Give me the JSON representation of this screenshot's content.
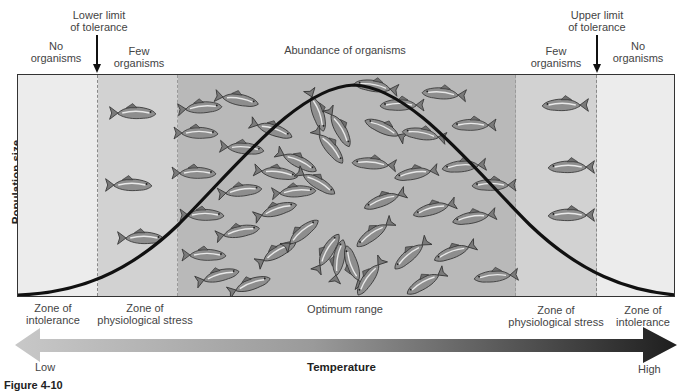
{
  "top_labels": {
    "lower_limit": [
      "Lower limit",
      "of tolerance"
    ],
    "upper_limit": [
      "Upper limit",
      "of tolerance"
    ],
    "left_no": [
      "No",
      "organisms"
    ],
    "left_few": [
      "Few",
      "organisms"
    ],
    "abundance": "Abundance of organisms",
    "right_few": [
      "Few",
      "organisms"
    ],
    "right_no": [
      "No",
      "organisms"
    ]
  },
  "y_axis_label": "Population size",
  "bottom_labels": {
    "left_intolerance": [
      "Zone of",
      "intolerance"
    ],
    "left_stress": [
      "Zone of",
      "physiological stress"
    ],
    "optimum": "Optimum range",
    "right_stress": [
      "Zone of",
      "physiological stress"
    ],
    "right_intolerance": [
      "Zone of",
      "intolerance"
    ]
  },
  "axis": {
    "low": "Low",
    "title": "Temperature",
    "high": "High"
  },
  "caption_fragment": "Figure 4-10",
  "colors": {
    "intolerance_zone": "#ececec",
    "stress_zone": "#d2d2d2",
    "optimum_zone": "#b9b9b9",
    "curve": "#111111",
    "arrow_light": "#c4c4c4",
    "arrow_dark": "#1e1e1e",
    "fish": "#8c8c8c"
  },
  "zones": [
    {
      "name": "Zone of intolerance (low)",
      "population": "No organisms"
    },
    {
      "name": "Zone of physiological stress (low)",
      "population": "Few organisms"
    },
    {
      "name": "Optimum range",
      "population": "Abundance of organisms"
    },
    {
      "name": "Zone of physiological stress (high)",
      "population": "Few organisms"
    },
    {
      "name": "Zone of intolerance (high)",
      "population": "No organisms"
    }
  ]
}
